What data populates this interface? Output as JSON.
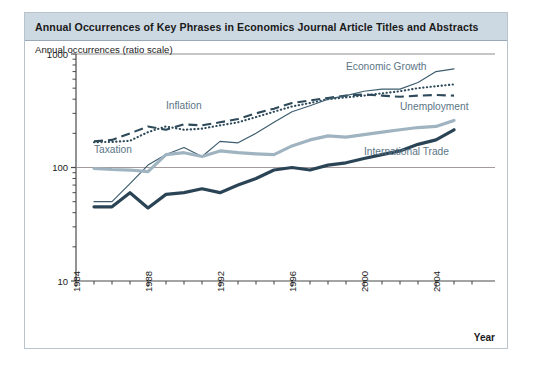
{
  "figure": {
    "title": "Annual Occurrences of Key Phrases in Economics Journal Article Titles and Abstracts",
    "ylabel": "Annual occurrences (ratio scale)",
    "xlabel": "Year"
  },
  "colors": {
    "title_bar": "#cdd9e2",
    "frame": "#b9c3cb",
    "axis": "#4a4a4a",
    "label_text": "#5b7585",
    "inflation": "#2e4a5a",
    "unemployment": "#2e4a5a",
    "economic_growth": "#3d5c6e",
    "taxation": "#9fb4c0",
    "international_trade": "#2a4456"
  },
  "chart_data": {
    "type": "line",
    "title": "Annual Occurrences of Key Phrases in Economics Journal Article Titles and Abstracts",
    "xlabel": "Year",
    "ylabel": "Annual occurrences (ratio scale)",
    "yscale": "log",
    "ylim": [
      10,
      1000
    ],
    "ytick_labels": [
      "1000",
      "100",
      "10"
    ],
    "ytick_values": [
      1000,
      100,
      10
    ],
    "xlim": [
      1984,
      2006
    ],
    "xtick_labels": [
      "1984",
      "1988",
      "1992",
      "1996",
      "2000",
      "2004"
    ],
    "xtick_values": [
      1984,
      1988,
      1992,
      1996,
      2000,
      2004
    ],
    "minor_ticks": true,
    "grid": false,
    "legend": "inline-annotations",
    "x": [
      1985,
      1986,
      1987,
      1988,
      1989,
      1990,
      1991,
      1992,
      1993,
      1994,
      1995,
      1996,
      1997,
      1998,
      1999,
      2000,
      2001,
      2002,
      2003,
      2004,
      2005
    ],
    "series": [
      {
        "name": "Inflation",
        "style": "dotted",
        "color": "#2e4a5a",
        "label_x": 1989,
        "label_y": 330,
        "values": [
          167,
          168,
          172,
          205,
          230,
          215,
          220,
          235,
          250,
          278,
          310,
          345,
          370,
          400,
          415,
          430,
          450,
          470,
          500,
          520,
          540
        ]
      },
      {
        "name": "Unemployment",
        "style": "dashed",
        "color": "#2e4a5a",
        "label_x": 2002,
        "label_y": 320,
        "values": [
          170,
          175,
          200,
          230,
          215,
          240,
          235,
          250,
          268,
          300,
          330,
          370,
          390,
          410,
          430,
          440,
          430,
          420,
          430,
          435,
          430
        ]
      },
      {
        "name": "Economic Growth",
        "style": "solid-thin",
        "color": "#3d5c6e",
        "label_x": 1999,
        "label_y": 720,
        "values": [
          50,
          50,
          72,
          105,
          130,
          150,
          125,
          170,
          165,
          200,
          250,
          310,
          350,
          400,
          430,
          470,
          490,
          490,
          560,
          700,
          740
        ]
      },
      {
        "name": "Taxation",
        "style": "solid-thick",
        "color": "#9fb4c0",
        "label_x": 1985,
        "label_y": 135,
        "values": [
          98,
          96,
          95,
          92,
          130,
          135,
          125,
          140,
          135,
          132,
          130,
          155,
          175,
          190,
          185,
          195,
          205,
          215,
          225,
          230,
          260
        ]
      },
      {
        "name": "International Trade",
        "style": "solid-thick",
        "color": "#2a4456",
        "label_x": 2000,
        "label_y": 130,
        "values": [
          45,
          45,
          60,
          44,
          58,
          60,
          65,
          60,
          70,
          80,
          95,
          100,
          95,
          105,
          110,
          120,
          130,
          140,
          160,
          175,
          215
        ]
      }
    ]
  }
}
